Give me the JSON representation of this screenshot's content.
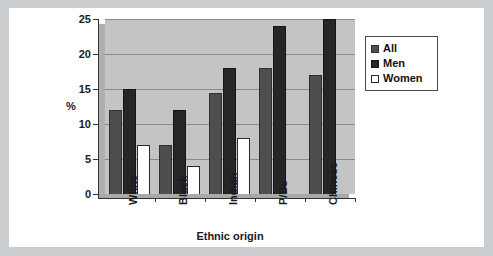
{
  "chart_data": {
    "type": "bar",
    "title": "",
    "xlabel": "Ethnic origin",
    "ylabel": "%",
    "categories": [
      "White",
      "Black",
      "Indian",
      "P/Bs",
      "Chinese"
    ],
    "series": [
      {
        "name": "All",
        "color": "#4e4e4e",
        "values": [
          12,
          7,
          14.5,
          18,
          17
        ]
      },
      {
        "name": "Men",
        "color": "#262626",
        "values": [
          15,
          12,
          18,
          24,
          25
        ]
      },
      {
        "name": "Women",
        "color": "#ffffff",
        "values": [
          7,
          4,
          8,
          null,
          null
        ]
      }
    ],
    "ylim": [
      0,
      25
    ],
    "yticks": [
      0,
      5,
      10,
      15,
      20,
      25
    ],
    "ytick_labels": [
      "0",
      "5",
      "10",
      "15",
      "20",
      "25"
    ],
    "grid": true,
    "legend_position": "right",
    "plot_background": "#c4c4c4",
    "frame_color": "#c9cdd0"
  },
  "legend": {
    "items": [
      {
        "label": "All"
      },
      {
        "label": "Men"
      },
      {
        "label": "Women"
      }
    ]
  }
}
